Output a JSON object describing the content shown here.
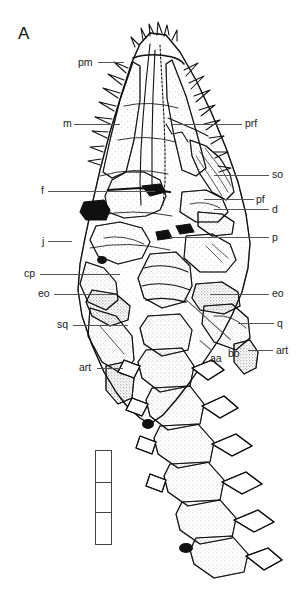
{
  "figure": {
    "panel_letter": "A",
    "background_color": "#ffffff",
    "ink_color": "#111111",
    "leader_color": "#555555"
  },
  "annotations": [
    {
      "id": "pm",
      "label": "pm",
      "side": "left",
      "label_x": 78,
      "label_y": 57,
      "leader_x": 98,
      "leader_y": 62,
      "leader_len": 26
    },
    {
      "id": "m",
      "label": "m",
      "side": "left",
      "label_x": 63,
      "label_y": 118,
      "leader_x": 74,
      "leader_y": 124,
      "leader_len": 46
    },
    {
      "id": "prf",
      "label": "prf",
      "side": "right",
      "label_x": 245,
      "label_y": 118,
      "leader_x": 172,
      "leader_y": 124,
      "leader_len": 70
    },
    {
      "id": "so",
      "label": "so",
      "side": "right",
      "label_x": 272,
      "label_y": 169,
      "leader_x": 214,
      "leader_y": 175,
      "leader_len": 55
    },
    {
      "id": "f",
      "label": "f",
      "side": "left",
      "label_x": 41,
      "label_y": 185,
      "leader_x": 48,
      "leader_y": 191,
      "leader_len": 107
    },
    {
      "id": "pf",
      "label": "pf",
      "side": "right",
      "label_x": 256,
      "label_y": 194,
      "leader_x": 204,
      "leader_y": 199,
      "leader_len": 50
    },
    {
      "id": "d",
      "label": "d",
      "side": "right",
      "label_x": 272,
      "label_y": 204,
      "leader_x": 214,
      "leader_y": 209,
      "leader_len": 55
    },
    {
      "id": "p",
      "label": "p",
      "side": "right",
      "label_x": 272,
      "label_y": 232,
      "leader_x": 170,
      "leader_y": 237,
      "leader_len": 99
    },
    {
      "id": "j",
      "label": "j",
      "side": "left",
      "label_x": 42,
      "label_y": 236,
      "leader_x": 48,
      "leader_y": 241,
      "leader_len": 24
    },
    {
      "id": "cp",
      "label": "cp",
      "side": "left",
      "label_x": 24,
      "label_y": 268,
      "leader_x": 40,
      "leader_y": 274,
      "leader_len": 80
    },
    {
      "id": "eo-left",
      "label": "eo",
      "side": "left",
      "label_x": 38,
      "label_y": 288,
      "leader_x": 54,
      "leader_y": 294,
      "leader_len": 62
    },
    {
      "id": "eo-right",
      "label": "eo",
      "side": "right",
      "label_x": 272,
      "label_y": 288,
      "leader_x": 210,
      "leader_y": 294,
      "leader_len": 59
    },
    {
      "id": "sq",
      "label": "sq",
      "side": "left",
      "label_x": 57,
      "label_y": 319,
      "leader_x": 73,
      "leader_y": 325,
      "leader_len": 55
    },
    {
      "id": "q",
      "label": "q",
      "side": "right",
      "label_x": 277,
      "label_y": 318,
      "leader_x": 238,
      "leader_y": 323,
      "leader_len": 36
    },
    {
      "id": "art-right",
      "label": "art",
      "side": "right",
      "label_x": 276,
      "label_y": 345,
      "leader_x": 248,
      "leader_y": 350,
      "leader_len": 25
    },
    {
      "id": "art-left",
      "label": "art",
      "side": "left",
      "label_x": 79,
      "label_y": 362,
      "leader_x": 97,
      "leader_y": 368,
      "leader_len": 26
    },
    {
      "id": "aa",
      "label": "aa",
      "side": "inline",
      "label_x": 210,
      "label_y": 353,
      "leader_x": 0,
      "leader_y": 0,
      "leader_len": 0
    },
    {
      "id": "bo",
      "label": "bo",
      "side": "inline",
      "label_x": 228,
      "label_y": 348,
      "leader_x": 0,
      "leader_y": 0,
      "leader_len": 0
    }
  ],
  "scale_bar": {
    "x": 95,
    "y": 450,
    "width": 17,
    "height": 95,
    "segments": 3,
    "border_color": "#444444"
  }
}
